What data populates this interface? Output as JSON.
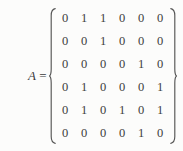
{
  "equation": {
    "label": "A",
    "equals": "=",
    "left_delimiter": "left-brace",
    "right_delimiter": "right-brace",
    "text_color": "#3c3c3c",
    "background_color": "#fcfcfb"
  },
  "matrix": {
    "rows": 6,
    "cols": 6,
    "values": [
      [
        "0",
        "1",
        "1",
        "0",
        "0",
        "0"
      ],
      [
        "0",
        "0",
        "1",
        "0",
        "0",
        "0"
      ],
      [
        "0",
        "0",
        "0",
        "0",
        "1",
        "0"
      ],
      [
        "0",
        "1",
        "0",
        "0",
        "0",
        "1"
      ],
      [
        "0",
        "1",
        "0",
        "1",
        "0",
        "1"
      ],
      [
        "0",
        "0",
        "0",
        "0",
        "1",
        "0"
      ]
    ]
  }
}
